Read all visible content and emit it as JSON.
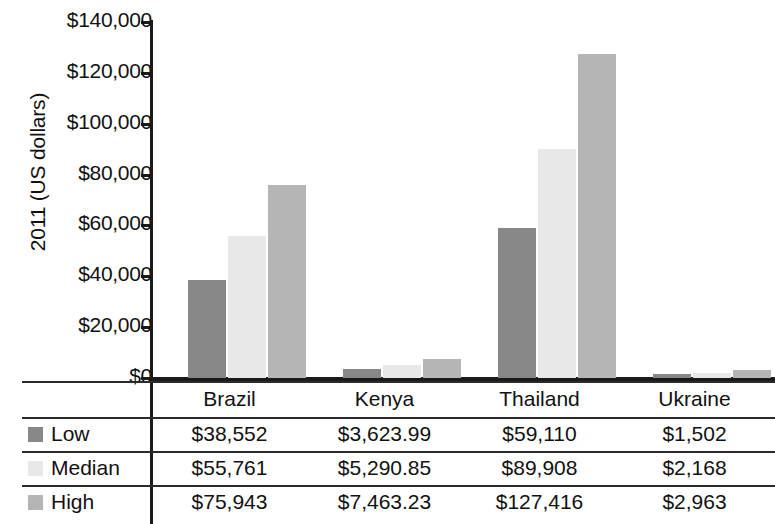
{
  "chart_data": {
    "type": "bar",
    "title": "",
    "xlabel": "",
    "ylabel": "2011 (US dollars)",
    "ylim": [
      0,
      140000
    ],
    "ytick_labels": [
      "$140,000",
      "$120,000",
      "$100,000",
      "$80,000",
      "$60,000",
      "$40,000",
      "$20,000",
      "$0"
    ],
    "ytick_values": [
      140000,
      120000,
      100000,
      80000,
      60000,
      40000,
      20000,
      0
    ],
    "grid": false,
    "legend_position": "table-left-column",
    "categories": [
      "Brazil",
      "Kenya",
      "Thailand",
      "Ukraine"
    ],
    "series": [
      {
        "name": "Low",
        "color": "#878787",
        "values": [
          38552,
          3623.99,
          59110,
          1502
        ],
        "labels": [
          "$38,552",
          "$3,623.99",
          "$59,110",
          "$1,502"
        ]
      },
      {
        "name": "Median",
        "color": "#e8e8e8",
        "values": [
          55761,
          5290.85,
          89908,
          2168
        ],
        "labels": [
          "$55,761",
          "$5,290.85",
          "$89,908",
          "$2,168"
        ]
      },
      {
        "name": "High",
        "color": "#b5b5b5",
        "values": [
          75943,
          7463.23,
          127416,
          2963
        ],
        "labels": [
          "$75,943",
          "$7,463.23",
          "$127,416",
          "$2,963"
        ]
      }
    ]
  },
  "table": {
    "corner_label": "",
    "column_headers": [
      "Brazil",
      "Kenya",
      "Thailand",
      "Ukraine"
    ],
    "rows": [
      {
        "label": "Low",
        "swatch": "#878787",
        "cells": [
          "$38,552",
          "$3,623.99",
          "$59,110",
          "$1,502"
        ]
      },
      {
        "label": "Median",
        "swatch": "#e8e8e8",
        "cells": [
          "$55,761",
          "$5,290.85",
          "$89,908",
          "$2,168"
        ]
      },
      {
        "label": "High",
        "swatch": "#b5b5b5",
        "cells": [
          "$75,943",
          "$7,463.23",
          "$127,416",
          "$2,963"
        ]
      }
    ]
  }
}
